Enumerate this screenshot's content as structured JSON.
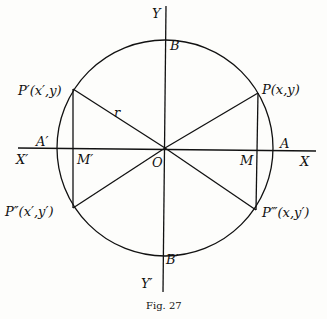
{
  "figure": {
    "caption": "Fig. 27",
    "labels": {
      "Y": "Y",
      "Y_prime": "Y′",
      "X": "X",
      "X_prime": "X′",
      "B": "B",
      "B_prime": "B′",
      "A": "A",
      "A_prime": "A′",
      "M": "M",
      "M_prime": "M′",
      "O": "O",
      "r": "r",
      "P": "P(x,y)",
      "P1": "P′(x′,y)",
      "P2": "P″(x′,y′)",
      "P3": "P‴(x,y′)"
    }
  }
}
